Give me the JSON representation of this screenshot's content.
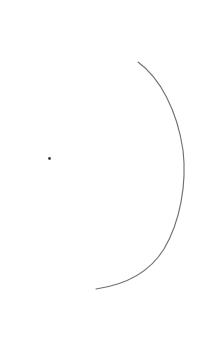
{
  "canvas": {
    "width": 200,
    "height": 353,
    "background_color": "#ffffff",
    "title": "Geometric Sketch"
  },
  "style": {
    "arc_stroke_color": "#6f6f72",
    "arc_stroke_width": 1.15,
    "point_color": "#3a3a3f"
  },
  "shapes": {
    "arc": {
      "name": "open-arc",
      "description": "Open circular arc bulging to the right, drawn as a thin hand-rendered line",
      "start": {
        "x": 138,
        "y": 62
      },
      "end": {
        "x": 96,
        "y": 289
      },
      "rightmost": {
        "x": 183.5,
        "y": 168
      },
      "radius_x": 92,
      "radius_y": 116,
      "path": "M 138 62 C 160 78 177 110 183 150 C 187 184 180 222 164 249 C 149 273 124 285 96 289"
    },
    "point": {
      "name": "center-point",
      "description": "Small filled dot to the left of the arc",
      "x": 49.5,
      "y": 158.5,
      "radius": 1.4
    }
  },
  "chart_data": {
    "type": "scatter",
    "title": "",
    "xlabel": "",
    "ylabel": "",
    "xlim": [
      0,
      200
    ],
    "ylim": [
      0,
      353
    ],
    "grid": false,
    "legend": null,
    "series": [
      {
        "name": "arc",
        "kind": "curve",
        "x": [
          138,
          152,
          165,
          175,
          181,
          184,
          183,
          179,
          172,
          163,
          151,
          137,
          120,
          107,
          96
        ],
        "y": [
          62,
          72,
          89,
          112,
          139,
          168,
          196,
          218,
          238,
          254,
          268,
          278,
          285,
          288,
          289
        ]
      },
      {
        "name": "point",
        "kind": "marker",
        "x": [
          49.5
        ],
        "y": [
          158.5
        ]
      }
    ]
  }
}
